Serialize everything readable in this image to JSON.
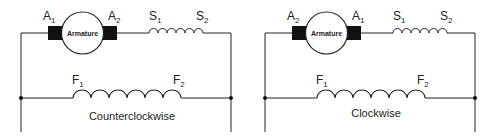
{
  "diagrams": [
    {
      "id": "ccw",
      "armature_label": "Armature",
      "brush_left": {
        "main": "A",
        "sub": "1"
      },
      "brush_right": {
        "main": "A",
        "sub": "2"
      },
      "series_left": {
        "main": "S",
        "sub": "1"
      },
      "series_right": {
        "main": "S",
        "sub": "2"
      },
      "field_left": {
        "main": "F",
        "sub": "1"
      },
      "field_right": {
        "main": "F",
        "sub": "2"
      },
      "caption": "Counterclockwise"
    },
    {
      "id": "cw",
      "armature_label": "Armature",
      "brush_left": {
        "main": "A",
        "sub": "2"
      },
      "brush_right": {
        "main": "A",
        "sub": "1"
      },
      "series_left": {
        "main": "S",
        "sub": "1"
      },
      "series_right": {
        "main": "S",
        "sub": "2"
      },
      "field_left": {
        "main": "F",
        "sub": "1"
      },
      "field_right": {
        "main": "F",
        "sub": "2"
      },
      "caption": "Clockwise"
    }
  ]
}
